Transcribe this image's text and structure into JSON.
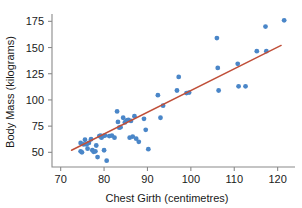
{
  "chart_data": {
    "type": "scatter",
    "title": "",
    "xlabel": "Chest Girth (centimetres)",
    "ylabel": "Body Mass (kilograms)",
    "xlim": [
      68,
      124
    ],
    "ylim": [
      36,
      182
    ],
    "xticks": [
      70,
      80,
      90,
      100,
      110,
      120
    ],
    "xtick_labels": [
      "70",
      "80",
      "90",
      "100",
      "110",
      "120"
    ],
    "yticks": [
      50,
      75,
      100,
      125,
      150,
      175
    ],
    "ytick_labels": [
      "50",
      "75",
      "100",
      "125",
      "150",
      "175"
    ],
    "grid": false,
    "legend": "none",
    "marker_color": "#4a86c8",
    "trend_line_color": "#c0503a",
    "axis_color": "#8a8a8a",
    "text_color": "#1a1a1a",
    "marker_radius": 2.4,
    "trend_line": {
      "x": [
        72.5,
        120.8
      ],
      "y": [
        52.0,
        152.0
      ]
    },
    "points": [
      {
        "x": 74.6,
        "y": 59.0
      },
      {
        "x": 74.6,
        "y": 51.0
      },
      {
        "x": 74.9,
        "y": 50.0
      },
      {
        "x": 75.3,
        "y": 57.5
      },
      {
        "x": 75.6,
        "y": 62.0
      },
      {
        "x": 76.0,
        "y": 57.5
      },
      {
        "x": 76.2,
        "y": 53.5
      },
      {
        "x": 76.5,
        "y": 59.0
      },
      {
        "x": 77.0,
        "y": 62.5
      },
      {
        "x": 77.3,
        "y": 52.0
      },
      {
        "x": 77.6,
        "y": 50.5
      },
      {
        "x": 78.0,
        "y": 51.0
      },
      {
        "x": 78.2,
        "y": 56.5
      },
      {
        "x": 78.5,
        "y": 45.5
      },
      {
        "x": 78.9,
        "y": 65.5
      },
      {
        "x": 79.2,
        "y": 66.0
      },
      {
        "x": 79.4,
        "y": 64.0
      },
      {
        "x": 79.8,
        "y": 65.5
      },
      {
        "x": 80.0,
        "y": 52.0
      },
      {
        "x": 80.2,
        "y": 66.0
      },
      {
        "x": 80.6,
        "y": 42.0
      },
      {
        "x": 81.2,
        "y": 65.5
      },
      {
        "x": 81.8,
        "y": 66.0
      },
      {
        "x": 82.4,
        "y": 64.0
      },
      {
        "x": 83.0,
        "y": 89.0
      },
      {
        "x": 83.2,
        "y": 79.0
      },
      {
        "x": 83.5,
        "y": 73.5
      },
      {
        "x": 83.8,
        "y": 74.0
      },
      {
        "x": 84.4,
        "y": 83.0
      },
      {
        "x": 84.8,
        "y": 78.5
      },
      {
        "x": 85.2,
        "y": 80.5
      },
      {
        "x": 85.6,
        "y": 81.0
      },
      {
        "x": 85.9,
        "y": 64.0
      },
      {
        "x": 86.2,
        "y": 80.0
      },
      {
        "x": 86.6,
        "y": 65.0
      },
      {
        "x": 87.0,
        "y": 84.5
      },
      {
        "x": 87.4,
        "y": 63.0
      },
      {
        "x": 88.0,
        "y": 60.0
      },
      {
        "x": 89.2,
        "y": 82.0
      },
      {
        "x": 89.6,
        "y": 71.5
      },
      {
        "x": 90.2,
        "y": 53.0
      },
      {
        "x": 92.4,
        "y": 104.5
      },
      {
        "x": 93.0,
        "y": 83.0
      },
      {
        "x": 93.6,
        "y": 94.5
      },
      {
        "x": 96.8,
        "y": 109.0
      },
      {
        "x": 97.2,
        "y": 122.0
      },
      {
        "x": 99.0,
        "y": 106.5
      },
      {
        "x": 99.6,
        "y": 107.0
      },
      {
        "x": 106.0,
        "y": 159.0
      },
      {
        "x": 106.2,
        "y": 130.5
      },
      {
        "x": 106.4,
        "y": 109.0
      },
      {
        "x": 110.8,
        "y": 134.5
      },
      {
        "x": 111.0,
        "y": 113.0
      },
      {
        "x": 112.6,
        "y": 113.0
      },
      {
        "x": 115.2,
        "y": 146.5
      },
      {
        "x": 117.2,
        "y": 170.0
      },
      {
        "x": 117.4,
        "y": 146.5
      },
      {
        "x": 121.5,
        "y": 176.0
      }
    ]
  }
}
